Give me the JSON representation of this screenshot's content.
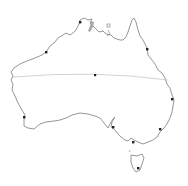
{
  "map": {
    "subject": "Australia outline",
    "colors": {
      "background": "#ffffff",
      "coastline": "#8a8a8a",
      "latitude_line": "#c8c8c8",
      "city_dot": "#222222",
      "lake": "#a8a8a8"
    },
    "latitude_line": {
      "label": "",
      "y_left": 77,
      "y_mid": 74,
      "y_right": 80
    },
    "city_markers": [
      {
        "name": "darwin",
        "x": 80,
        "y": 22
      },
      {
        "name": "cairns",
        "x": 147,
        "y": 49
      },
      {
        "name": "broome",
        "x": 46,
        "y": 52
      },
      {
        "name": "alice-springs",
        "x": 95,
        "y": 75
      },
      {
        "name": "brisbane",
        "x": 172,
        "y": 99
      },
      {
        "name": "perth",
        "x": 24,
        "y": 117
      },
      {
        "name": "sydney",
        "x": 160,
        "y": 129
      },
      {
        "name": "adelaide",
        "x": 113,
        "y": 127
      },
      {
        "name": "melbourne",
        "x": 133,
        "y": 142
      },
      {
        "name": "hobart",
        "x": 138,
        "y": 168
      }
    ]
  }
}
